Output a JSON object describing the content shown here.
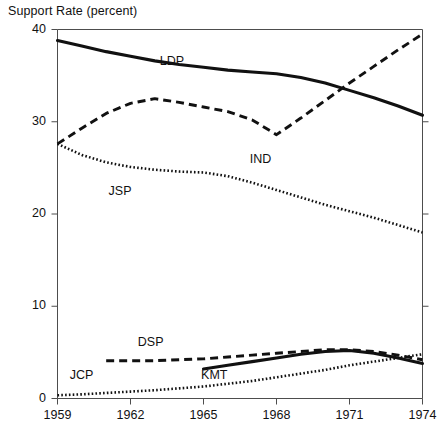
{
  "chart_data": {
    "type": "line",
    "title": "Support Rate  (percent)",
    "xlabel": "",
    "ylabel": "",
    "xlim": [
      1959,
      1974
    ],
    "ylim": [
      0,
      40
    ],
    "grid": false,
    "legend_position": "inline-labels",
    "x_tick_labels": [
      "1959",
      "1962",
      "1965",
      "1968",
      "1971",
      "1974"
    ],
    "x_ticks": [
      1959,
      1962,
      1965,
      1968,
      1971,
      1974
    ],
    "y_tick_labels": [
      "0",
      "10",
      "20",
      "30",
      "40"
    ],
    "y_ticks": [
      0,
      10,
      20,
      30,
      40
    ],
    "series": [
      {
        "name": "LDP",
        "style": "solid",
        "label_x": 1963.2,
        "label_y": 36.5,
        "x": [
          1959,
          1960,
          1961,
          1962,
          1963,
          1964,
          1965,
          1966,
          1967,
          1968,
          1969,
          1970,
          1971,
          1972,
          1973,
          1974
        ],
        "values": [
          38.8,
          38.2,
          37.6,
          37.1,
          36.6,
          36.2,
          35.9,
          35.6,
          35.4,
          35.2,
          34.8,
          34.2,
          33.4,
          32.6,
          31.7,
          30.7
        ]
      },
      {
        "name": "IND",
        "style": "dashed",
        "label_x": 1966.9,
        "label_y": 25.9,
        "x": [
          1959,
          1960,
          1961,
          1962,
          1963,
          1964,
          1965,
          1966,
          1967,
          1968,
          1969,
          1970,
          1971,
          1972,
          1973,
          1974
        ],
        "values": [
          27.6,
          29.3,
          30.9,
          32.0,
          32.5,
          32.1,
          31.6,
          31.1,
          30.2,
          28.6,
          30.4,
          32.3,
          34.2,
          36.0,
          37.8,
          39.5
        ]
      },
      {
        "name": "JSP",
        "style": "dotted",
        "label_x": 1961.1,
        "label_y": 22.4,
        "x": [
          1959,
          1960,
          1961,
          1962,
          1963,
          1964,
          1965,
          1966,
          1967,
          1968,
          1969,
          1970,
          1971,
          1972,
          1973,
          1974
        ],
        "values": [
          27.6,
          26.4,
          25.6,
          25.1,
          24.8,
          24.6,
          24.5,
          24.1,
          23.4,
          22.6,
          21.8,
          21.0,
          20.3,
          19.6,
          18.8,
          18.0
        ]
      },
      {
        "name": "DSP",
        "style": "dashed",
        "label_x": 1962.3,
        "label_y": 6.0,
        "x": [
          1961,
          1962,
          1963,
          1964,
          1965,
          1966,
          1967,
          1968,
          1969,
          1970,
          1971,
          1972,
          1973,
          1974
        ],
        "values": [
          4.1,
          4.1,
          4.1,
          4.2,
          4.3,
          4.5,
          4.7,
          4.9,
          5.1,
          5.3,
          5.3,
          5.1,
          4.7,
          4.2
        ]
      },
      {
        "name": "KMT",
        "style": "solid",
        "label_x": 1964.9,
        "label_y": 2.4,
        "x": [
          1965,
          1966,
          1967,
          1968,
          1969,
          1970,
          1971,
          1972,
          1973,
          1974
        ],
        "values": [
          3.2,
          3.6,
          4.0,
          4.4,
          4.8,
          5.1,
          5.2,
          4.9,
          4.4,
          3.8
        ]
      },
      {
        "name": "JCP",
        "style": "dotted",
        "label_x": 1959.5,
        "label_y": 2.4,
        "x": [
          1959,
          1960,
          1961,
          1962,
          1963,
          1964,
          1965,
          1966,
          1967,
          1968,
          1969,
          1970,
          1971,
          1972,
          1973,
          1974
        ],
        "values": [
          0.35,
          0.45,
          0.6,
          0.75,
          0.9,
          1.1,
          1.3,
          1.6,
          1.9,
          2.3,
          2.7,
          3.1,
          3.6,
          4.0,
          4.4,
          4.8
        ]
      }
    ]
  }
}
